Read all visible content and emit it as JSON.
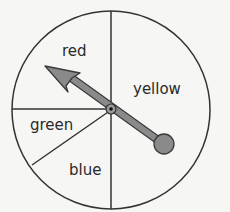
{
  "spinner": {
    "sections": [
      {
        "label": "red",
        "x": 62,
        "y": 44
      },
      {
        "label": "yellow",
        "x": 133,
        "y": 82
      },
      {
        "label": "green",
        "x": 30,
        "y": 118
      },
      {
        "label": "blue",
        "x": 69,
        "y": 163
      }
    ],
    "colors": {
      "background": "#f6f6f4",
      "line": "#333333",
      "pointer_fill": "#8a8a8a",
      "pointer_outline": "#3a3a3a"
    },
    "pointer_pointing_to": "red"
  }
}
